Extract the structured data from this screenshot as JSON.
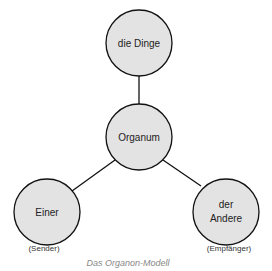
{
  "diagram": {
    "title": "Das Organon-Modell",
    "colors": {
      "node_fill": "#e3e3e3",
      "node_stroke": "#111111",
      "edge": "#111111",
      "caption": "#888888"
    },
    "nodes": [
      {
        "id": "dinge",
        "label_lines": [
          "die Dinge"
        ],
        "cx": 139,
        "cy": 43,
        "r": 33
      },
      {
        "id": "organum",
        "label_lines": [
          "Organum"
        ],
        "cx": 139,
        "cy": 137,
        "r": 33
      },
      {
        "id": "einer",
        "label_lines": [
          "Einer"
        ],
        "cx": 47,
        "cy": 212,
        "r": 33,
        "sub_label": "(Sender)"
      },
      {
        "id": "andere",
        "label_lines": [
          "der",
          "Andere"
        ],
        "cx": 226,
        "cy": 212,
        "r": 33,
        "sub_label": "(Empfänger)"
      }
    ],
    "edges": [
      {
        "from": "organum",
        "to": "dinge"
      },
      {
        "from": "organum",
        "to": "einer"
      },
      {
        "from": "organum",
        "to": "andere"
      }
    ]
  }
}
